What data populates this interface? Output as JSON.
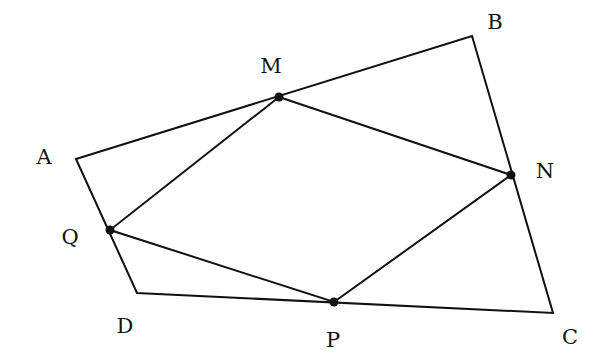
{
  "diagram": {
    "type": "geometry",
    "colors": {
      "stroke": "#111111",
      "background": "#ffffff"
    },
    "vertices": {
      "A": {
        "x": 76,
        "y": 159
      },
      "B": {
        "x": 472,
        "y": 36
      },
      "C": {
        "x": 553,
        "y": 313
      },
      "D": {
        "x": 137,
        "y": 293
      }
    },
    "points": {
      "M": {
        "x": 279,
        "y": 97
      },
      "N": {
        "x": 511,
        "y": 175
      },
      "P": {
        "x": 334,
        "y": 302
      },
      "Q": {
        "x": 110,
        "y": 230
      }
    },
    "outer_polygon": [
      "A",
      "B",
      "C",
      "D"
    ],
    "inner_polygon": [
      "M",
      "N",
      "P",
      "Q"
    ],
    "labels": [
      {
        "id": "A",
        "text": "A",
        "x": 44,
        "y": 157
      },
      {
        "id": "B",
        "text": "B",
        "x": 495,
        "y": 22
      },
      {
        "id": "C",
        "text": "C",
        "x": 570,
        "y": 337
      },
      {
        "id": "D",
        "text": "D",
        "x": 125,
        "y": 326
      },
      {
        "id": "M",
        "text": "M",
        "x": 271,
        "y": 66
      },
      {
        "id": "N",
        "text": "N",
        "x": 545,
        "y": 171
      },
      {
        "id": "P",
        "text": "P",
        "x": 333,
        "y": 340
      },
      {
        "id": "Q",
        "text": "Q",
        "x": 70,
        "y": 237
      }
    ]
  }
}
